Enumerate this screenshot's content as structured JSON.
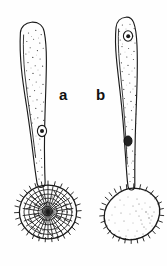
{
  "figure": {
    "title": "",
    "background_color": "#fefefe",
    "ink_color": "#1a1a1a",
    "width": 167,
    "height": 266,
    "style": "pen-and-ink line drawing, stippled shading"
  },
  "labels": [
    {
      "id": "label-a",
      "text": "a",
      "x": 59,
      "y": 100
    },
    {
      "id": "label-b",
      "text": "b",
      "x": 96,
      "y": 100
    }
  ],
  "specimens": [
    {
      "id": "specimen-a",
      "label": "a",
      "stalk": {
        "name": "clavate-stalk",
        "apex_y": 22,
        "base_y": 183,
        "apex_width": 22,
        "description": "club-shaped, broad rounded apex tapering to narrow base, stippled interior"
      },
      "head": {
        "name": "spore-head-reticulate",
        "center_x": 48,
        "center_y": 212,
        "radius_x": 29,
        "radius_y": 27,
        "surface": "reticulate",
        "ornamentation": "net-like ridges with marginal spines",
        "spine_count": 46
      },
      "nuclei": [
        {
          "name": "nucleus",
          "x": 42,
          "y": 131,
          "rx": 4.5,
          "ry": 5.5,
          "fill": "open"
        }
      ]
    },
    {
      "id": "specimen-b",
      "label": "b",
      "stalk": {
        "name": "clavate-stalk",
        "apex_y": 17,
        "base_y": 186,
        "apex_width": 19,
        "description": "slender club-shaped, narrow rounded apex tapering to base, stippled interior"
      },
      "head": {
        "name": "spore-head-echinulate",
        "center_x": 132,
        "center_y": 214,
        "radius_x": 27,
        "radius_y": 26,
        "surface": "smooth",
        "ornamentation": "finely stippled with marginal spines",
        "spine_count": 42
      },
      "nuclei": [
        {
          "name": "nucleus-upper",
          "x": 128,
          "y": 36,
          "rx": 4.5,
          "ry": 5.0,
          "fill": "open"
        },
        {
          "name": "nucleus-lower",
          "x": 128,
          "y": 141,
          "rx": 4.0,
          "ry": 5.0,
          "fill": "filled"
        }
      ]
    }
  ]
}
